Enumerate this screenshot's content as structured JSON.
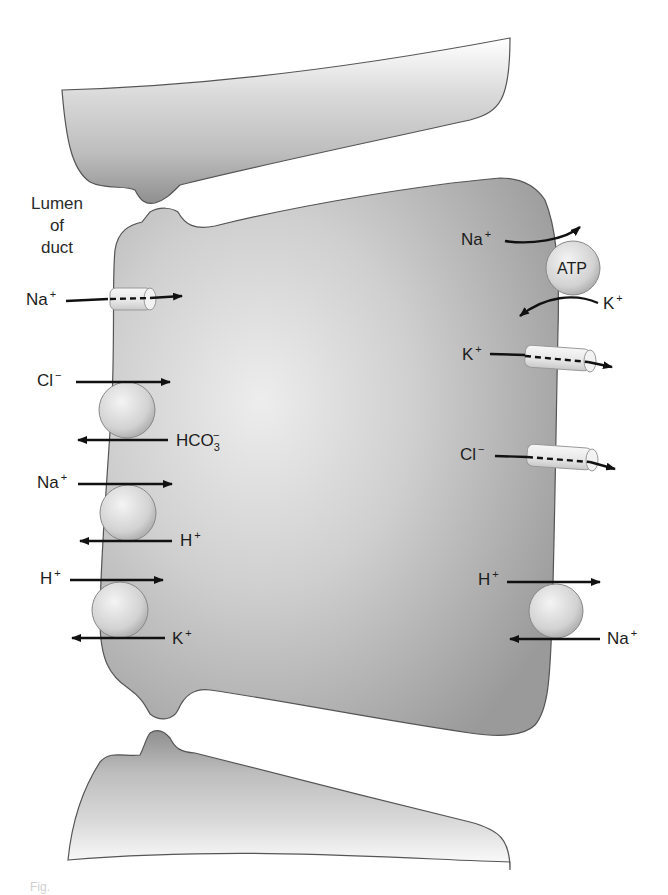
{
  "diagram": {
    "title_label": {
      "line1": "Lumen",
      "line2": "of",
      "line3": "duct"
    },
    "colors": {
      "cell_fill": "#a9a9a9",
      "cell_highlight": "#ececec",
      "cell_outline": "#555555",
      "transporter_fill": "#e2e2e2",
      "arrow": "#111111",
      "text": "#1c1c1c"
    },
    "luminal_side": {
      "channels": [
        {
          "ion": "Na",
          "charge": "+",
          "direction": "into cell",
          "type": "channel"
        }
      ],
      "exchangers": [
        {
          "in_ion": "Cl",
          "in_charge": "−",
          "out_ion": "HCO",
          "out_sub": "3",
          "out_charge": "−"
        },
        {
          "in_ion": "Na",
          "in_charge": "+",
          "out_ion": "H",
          "out_charge": "+"
        },
        {
          "in_ion": "H",
          "in_charge": "+",
          "out_ion": "K",
          "out_charge": "+"
        }
      ]
    },
    "basolateral_side": {
      "pump": {
        "label": "ATP",
        "out_ion": "Na",
        "out_charge": "+",
        "in_ion": "K",
        "in_charge": "+"
      },
      "channels": [
        {
          "ion": "K",
          "charge": "+",
          "direction": "out of cell"
        },
        {
          "ion": "Cl",
          "charge": "−",
          "direction": "out of cell"
        }
      ],
      "exchanger": {
        "out_ion": "H",
        "out_charge": "+",
        "in_ion": "Na",
        "in_charge": "+"
      }
    },
    "caption": "Fig."
  }
}
